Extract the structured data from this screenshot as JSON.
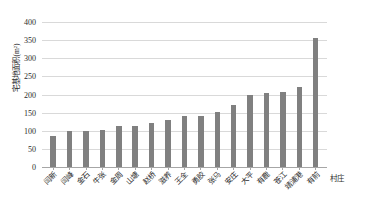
{
  "chart_data": {
    "type": "bar",
    "title": "",
    "subtitle": "",
    "xlabel": "村庄",
    "ylabel": "宅基地面积(m²)",
    "ylim": [
      0,
      400
    ],
    "ytick_values": [
      400,
      350,
      300,
      250,
      200,
      150,
      100,
      50,
      0
    ],
    "ytick_labels": [
      "400",
      "350",
      "300",
      "250",
      "200",
      "150",
      "100",
      "50",
      "0"
    ],
    "grid": true,
    "legend": "none",
    "bar_color": "#808080",
    "gridline_color": "#d9d9d9",
    "axis_color": "#a6a6a6",
    "text_color": "#2b2b2b",
    "categories": [
      "闫新",
      "闫峰",
      "金石",
      "牛张",
      "金周",
      "山塘",
      "赵桥",
      "滋养",
      "王全",
      "勇胶",
      "张马",
      "安庄",
      "大平",
      "有鹿",
      "苍江",
      "靖浦港",
      "有前"
    ],
    "values": [
      85,
      98,
      98,
      102,
      113,
      113,
      122,
      130,
      140,
      142,
      152,
      170,
      200,
      205,
      208,
      222,
      355
    ],
    "series": [
      {
        "name": "宅基地面积",
        "values": [
          85,
          98,
          98,
          102,
          113,
          113,
          122,
          130,
          140,
          142,
          152,
          170,
          200,
          205,
          208,
          222,
          355
        ]
      }
    ]
  }
}
